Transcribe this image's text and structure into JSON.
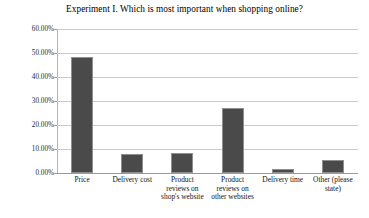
{
  "chart_data": {
    "type": "bar",
    "title": "Experiment I. Which is most important when shopping online?",
    "xlabel": "",
    "ylabel": "",
    "categories": [
      "Price",
      "Delivery cost",
      "Product reviews on shop's website",
      "Product reviews on other websites",
      "Delivery time",
      "Other (please state)"
    ],
    "category_lines": [
      [
        "Price"
      ],
      [
        "Delivery cost"
      ],
      [
        "Product",
        "reviews on",
        "shop's website"
      ],
      [
        "Product",
        "reviews on",
        "other websites"
      ],
      [
        "Delivery time"
      ],
      [
        "Other (please",
        "state)"
      ]
    ],
    "values": [
      48.5,
      8.0,
      8.3,
      27.0,
      1.8,
      5.5
    ],
    "ylim": [
      0,
      60
    ],
    "ytick_values": [
      0,
      10,
      20,
      30,
      40,
      50,
      60
    ],
    "ytick_labels": [
      "0.00%",
      "10.00%",
      "20.00%",
      "30.00%",
      "40.00%",
      "50.00%",
      "60.00%"
    ],
    "grid": true,
    "legend": null,
    "bar_color": "#4a4a4a",
    "gridline_color": "#c9c9c9",
    "background_color": "#ffffff"
  }
}
